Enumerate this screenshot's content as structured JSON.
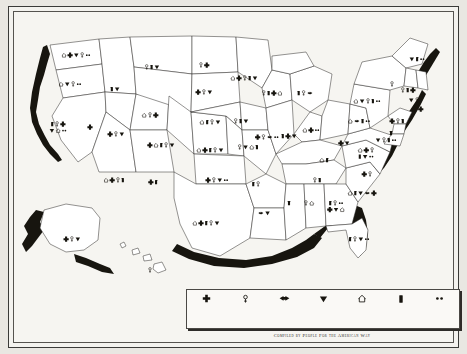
{
  "caption": "Compiled by People For the American Way",
  "legend": {
    "items": [
      {
        "icon": "cross-plus-icon",
        "label": "Sex Education"
      },
      {
        "icon": "venus-female-icon",
        "label": "Reproductive Freedom"
      },
      {
        "icon": "bow-ribbon-icon",
        "label": "Motor Voter"
      },
      {
        "icon": "down-triangle-icon",
        "label": "Anti-Gay"
      },
      {
        "icon": "house-home-icon",
        "label": "“Parental Rights” Movements"
      },
      {
        "icon": "book-block-icon",
        "label": "Attacks on Public Education"
      },
      {
        "icon": "two-dots-icon",
        "label": "Free Expression"
      }
    ]
  },
  "map": {
    "states": [
      {
        "name": "WASHINGTON",
        "x": 62,
        "y": 38,
        "icons": [
          "house",
          "plus",
          "triangle",
          "venus",
          "dots"
        ]
      },
      {
        "name": "OREGON",
        "x": 56,
        "y": 67,
        "icons": [
          "house",
          "triangle",
          "venus",
          "dots"
        ]
      },
      {
        "name": "IDAHO",
        "x": 101,
        "y": 72,
        "icons": [
          "book",
          "triangle"
        ]
      },
      {
        "name": "MONTANA",
        "x": 138,
        "y": 50,
        "icons": [
          "venus",
          "book",
          "triangle"
        ]
      },
      {
        "name": "NORTH DAKOTA",
        "x": 190,
        "y": 48,
        "icons": [
          "venus",
          "plus"
        ]
      },
      {
        "name": "SOUTH DAKOTA",
        "x": 190,
        "y": 75,
        "icons": [
          "plus",
          "venus",
          "triangle"
        ]
      },
      {
        "name": "MINNESOTA",
        "x": 230,
        "y": 61,
        "icons": [
          "house",
          "plus",
          "venus",
          "book",
          "triangle"
        ]
      },
      {
        "name": "WISCONSIN",
        "x": 258,
        "y": 76,
        "icons": [
          "venus",
          "book",
          "plus",
          "house"
        ]
      },
      {
        "name": "MICHIGAN",
        "x": 291,
        "y": 76,
        "icons": [
          "book",
          "venus",
          "bow"
        ]
      },
      {
        "name": "CALIFORNIA",
        "x": 44,
        "y": 107,
        "icons": [
          "book",
          "venus",
          "plus",
          "triangle",
          "house",
          "dots"
        ]
      },
      {
        "name": "NEVADA",
        "x": 76,
        "y": 110,
        "icons": [
          "plus"
        ]
      },
      {
        "name": "UTAH",
        "x": 102,
        "y": 117,
        "icons": [
          "plus",
          "venus",
          "triangle"
        ]
      },
      {
        "name": "WYOMING",
        "x": 136,
        "y": 98,
        "icons": [
          "house",
          "venus",
          "plus"
        ]
      },
      {
        "name": "COLORADO",
        "x": 147,
        "y": 128,
        "icons": [
          "plus",
          "house",
          "book",
          "venus",
          "triangle"
        ]
      },
      {
        "name": "NEBRASKA",
        "x": 196,
        "y": 105,
        "icons": [
          "house",
          "book",
          "venus",
          "triangle"
        ]
      },
      {
        "name": "IOWA",
        "x": 227,
        "y": 104,
        "icons": [
          "venus",
          "book",
          "triangle"
        ]
      },
      {
        "name": "KANSAS",
        "x": 196,
        "y": 133,
        "icons": [
          "house",
          "plus",
          "book",
          "venus",
          "triangle"
        ]
      },
      {
        "name": "MISSOURI",
        "x": 234,
        "y": 130,
        "icons": [
          "venus",
          "triangle",
          "house",
          "book"
        ]
      },
      {
        "name": "ILLINOIS",
        "x": 253,
        "y": 120,
        "icons": [
          "plus",
          "venus",
          "bow",
          "dots"
        ]
      },
      {
        "name": "INDIANA",
        "x": 275,
        "y": 119,
        "icons": [
          "book",
          "plus",
          "triangle"
        ]
      },
      {
        "name": "OHIO",
        "x": 297,
        "y": 113,
        "icons": [
          "house",
          "plus",
          "dots"
        ]
      },
      {
        "name": "MAINE",
        "x": 403,
        "y": 42,
        "icons": [
          "triangle",
          "book",
          "dots"
        ]
      },
      {
        "name": "NEW HAMPSHIRE",
        "x": 394,
        "y": 73,
        "icons": [
          "venus",
          "book",
          "plus"
        ]
      },
      {
        "name": "VERMONT",
        "x": 378,
        "y": 67,
        "icons": [
          "venus"
        ]
      },
      {
        "name": "MASSACHUSETTS",
        "x": 400,
        "y": 83,
        "icons": [
          "triangle",
          "venus"
        ]
      },
      {
        "name": "NEW YORK",
        "x": 353,
        "y": 84,
        "icons": [
          "house",
          "triangle",
          "venus",
          "book",
          "dots"
        ]
      },
      {
        "name": "CONNECTICUT",
        "x": 404,
        "y": 92,
        "icons": [
          "venus",
          "plus"
        ]
      },
      {
        "name": "RHODE ISLAND",
        "x": 414,
        "y": 88,
        "icons": []
      },
      {
        "name": "PENNSYLVANIA",
        "x": 345,
        "y": 104,
        "icons": [
          "house",
          "bow",
          "book",
          "dots"
        ]
      },
      {
        "name": "NEW JERSEY",
        "x": 383,
        "y": 104,
        "icons": [
          "plus",
          "venus",
          "book"
        ]
      },
      {
        "name": "DELAWARE",
        "x": 377,
        "y": 116,
        "icons": [
          "book"
        ]
      },
      {
        "name": "MARYLAND",
        "x": 372,
        "y": 123,
        "icons": [
          "triangle",
          "venus",
          "book",
          "dots"
        ]
      },
      {
        "name": "WEST VIRGINIA",
        "x": 330,
        "y": 126,
        "icons": [
          "plus",
          "triangle"
        ]
      },
      {
        "name": "VIRGINIA",
        "x": 352,
        "y": 133,
        "icons": [
          "house",
          "plus",
          "venus",
          "book",
          "triangle",
          "dots"
        ]
      },
      {
        "name": "KENTUCKY",
        "x": 310,
        "y": 143,
        "icons": [
          "house",
          "book"
        ]
      },
      {
        "name": "TENNESSEE",
        "x": 303,
        "y": 163,
        "icons": [
          "venus",
          "book"
        ]
      },
      {
        "name": "NORTH CAROLINA",
        "x": 353,
        "y": 157,
        "icons": [
          "plus",
          "venus"
        ]
      },
      {
        "name": "SOUTH CAROLINA",
        "x": 348,
        "y": 176,
        "icons": [
          "house",
          "book",
          "triangle",
          "bow",
          "plus"
        ]
      },
      {
        "name": "ARKANSAS",
        "x": 242,
        "y": 167,
        "icons": [
          "book",
          "venus"
        ]
      },
      {
        "name": "LOUISIANA",
        "x": 250,
        "y": 196,
        "icons": [
          "bow",
          "triangle"
        ]
      },
      {
        "name": "MISSISSIPPI",
        "x": 275,
        "y": 186,
        "icons": [
          "book"
        ]
      },
      {
        "name": "ALABAMA",
        "x": 295,
        "y": 186,
        "icons": [
          "venus",
          "house"
        ]
      },
      {
        "name": "GEORGIA",
        "x": 322,
        "y": 186,
        "icons": [
          "book",
          "venus",
          "dots",
          "plus",
          "triangle",
          "house"
        ]
      },
      {
        "name": "FLORIDA",
        "x": 345,
        "y": 222,
        "icons": [
          "book",
          "venus",
          "triangle",
          "dots"
        ]
      },
      {
        "name": "OKLAHOMA",
        "x": 203,
        "y": 163,
        "icons": [
          "plus",
          "venus",
          "triangle",
          "dots"
        ]
      },
      {
        "name": "TEXAS",
        "x": 192,
        "y": 206,
        "icons": [
          "house",
          "plus",
          "book",
          "venus",
          "triangle"
        ]
      },
      {
        "name": "NEW MEXICO",
        "x": 139,
        "y": 165,
        "icons": [
          "plus",
          "book"
        ]
      },
      {
        "name": "ARIZONA",
        "x": 100,
        "y": 163,
        "icons": [
          "house",
          "plus",
          "venus",
          "book"
        ]
      },
      {
        "name": "ALASKA",
        "x": 58,
        "y": 222,
        "icons": [
          "plus",
          "venus",
          "triangle"
        ]
      },
      {
        "name": "HAWAII",
        "x": 136,
        "y": 253,
        "icons": [
          "venus"
        ]
      }
    ]
  }
}
